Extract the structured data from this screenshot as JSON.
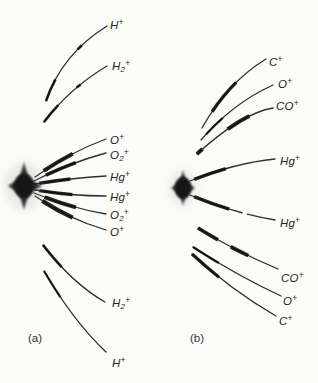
{
  "figure": {
    "colors": {
      "background": "#fbfbf8",
      "trace": "#2f2f2f",
      "streak": "#111111",
      "spot": "#161616",
      "label_ink": "#242424"
    },
    "panels": {
      "a": {
        "caption": "(a)",
        "labels": {
          "h_upper": {
            "base": "H",
            "sub": "",
            "sup": "+"
          },
          "h2_upper": {
            "base": "H",
            "sub": "2",
            "sup": "+"
          },
          "o_upper": {
            "base": "O",
            "sub": "",
            "sup": "+"
          },
          "o2_upper": {
            "base": "O",
            "sub": "2",
            "sup": "+"
          },
          "hg_upper": {
            "base": "Hg",
            "sub": "",
            "sup": "+"
          },
          "hg_lower": {
            "base": "Hg",
            "sub": "",
            "sup": "+"
          },
          "o2_lower": {
            "base": "O",
            "sub": "2",
            "sup": "+"
          },
          "o_lower": {
            "base": "O",
            "sub": "",
            "sup": "+"
          },
          "h2_lower": {
            "base": "H",
            "sub": "2",
            "sup": "+"
          },
          "h_lower": {
            "base": "H",
            "sub": "",
            "sup": "+"
          }
        }
      },
      "b": {
        "caption": "(b)",
        "labels": {
          "c_upper": {
            "base": "C",
            "sub": "",
            "sup": "+"
          },
          "o_upper": {
            "base": "O",
            "sub": "",
            "sup": "+"
          },
          "co_upper": {
            "base": "CO",
            "sub": "",
            "sup": "+"
          },
          "hg_upper": {
            "base": "Hg",
            "sub": "",
            "sup": "+"
          },
          "hg_lower": {
            "base": "Hg",
            "sub": "",
            "sup": "+"
          },
          "co_lower": {
            "base": "CO",
            "sub": "",
            "sup": "+"
          },
          "o_lower": {
            "base": "O",
            "sub": "",
            "sup": "+"
          },
          "c_lower": {
            "base": "C",
            "sub": "",
            "sup": "+"
          }
        }
      }
    }
  }
}
